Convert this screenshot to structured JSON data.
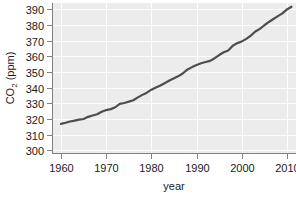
{
  "chart_data": {
    "type": "line",
    "title": "",
    "xlabel": "year",
    "ylabel_main": "CO",
    "ylabel_sub": "2",
    "ylabel_units": " (ppm)",
    "ylabel_full": "CO2 (ppm)",
    "xlim": [
      1958,
      2012
    ],
    "ylim": [
      298,
      394
    ],
    "grid": true,
    "legend": "none",
    "plot_background": "#ececec",
    "grid_color": "#ffffff",
    "axis_color": "#808080",
    "line_color": "#4d4d4d",
    "line_width": 2.2,
    "xticks": [
      1960,
      1970,
      1980,
      1990,
      2000,
      2010
    ],
    "xtick_labels": [
      "1960",
      "1970",
      "1980",
      "1990",
      "2000",
      "2010"
    ],
    "yticks": [
      300,
      310,
      320,
      330,
      340,
      350,
      360,
      370,
      380,
      390
    ],
    "ytick_labels": [
      "300",
      "310",
      "320",
      "330",
      "340",
      "350",
      "360",
      "370",
      "380",
      "390"
    ],
    "series": [
      {
        "name": "Atmospheric CO2 concentration",
        "x": [
          1960,
          1961,
          1962,
          1963,
          1964,
          1965,
          1966,
          1967,
          1968,
          1969,
          1970,
          1971,
          1972,
          1973,
          1974,
          1975,
          1976,
          1977,
          1978,
          1979,
          1980,
          1981,
          1982,
          1983,
          1984,
          1985,
          1986,
          1987,
          1988,
          1989,
          1990,
          1991,
          1992,
          1993,
          1994,
          1995,
          1996,
          1997,
          1998,
          1999,
          2000,
          2001,
          2002,
          2003,
          2004,
          2005,
          2006,
          2007,
          2008,
          2009,
          2010,
          2011
        ],
        "values": [
          316.9,
          317.6,
          318.4,
          319.0,
          319.6,
          320.0,
          321.4,
          322.2,
          323.0,
          324.6,
          325.7,
          326.3,
          327.5,
          329.7,
          330.2,
          331.1,
          332.0,
          333.8,
          335.4,
          336.8,
          338.7,
          340.1,
          341.4,
          343.0,
          344.6,
          346.0,
          347.4,
          349.2,
          351.6,
          353.1,
          354.4,
          355.6,
          356.4,
          357.1,
          358.8,
          360.8,
          362.6,
          363.7,
          366.7,
          368.4,
          369.5,
          371.1,
          373.2,
          375.8,
          377.5,
          379.8,
          381.9,
          383.8,
          385.6,
          387.4,
          389.9,
          391.6
        ]
      }
    ]
  }
}
